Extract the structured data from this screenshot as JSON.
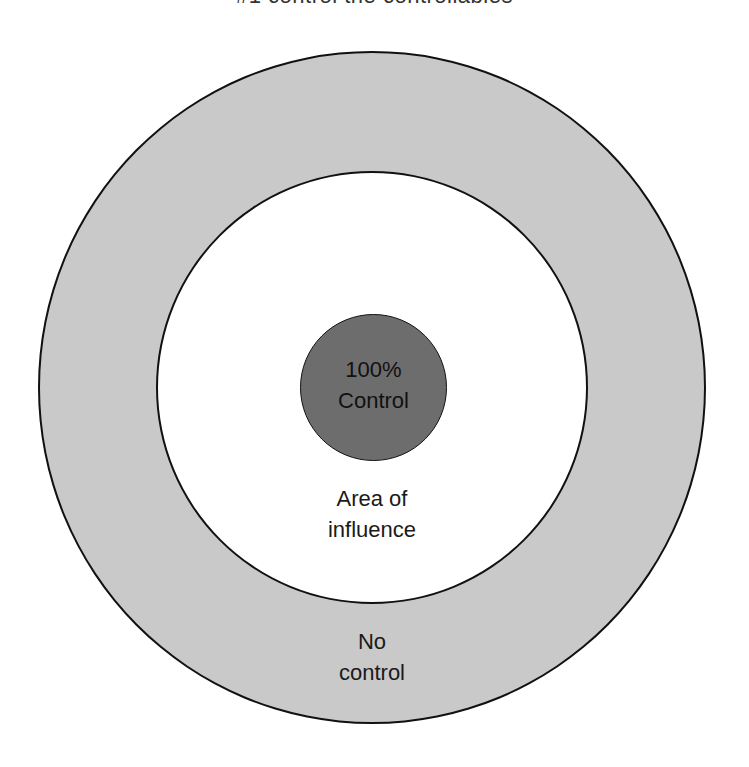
{
  "title": "#1 control the controllables",
  "diagram": {
    "type": "concentric-circles",
    "rings": [
      {
        "id": "outer",
        "fill": "#c9c9c9",
        "label_lines": [
          "No",
          "control"
        ]
      },
      {
        "id": "middle",
        "fill": "#ffffff",
        "label_lines": [
          "Area of",
          "influence"
        ]
      },
      {
        "id": "core",
        "fill": "#6d6d6d",
        "label_lines": [
          "100%",
          "Control"
        ]
      }
    ],
    "stroke_color": "#111111"
  }
}
